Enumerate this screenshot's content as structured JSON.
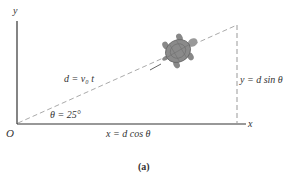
{
  "figure": {
    "caption": "(a)",
    "axes": {
      "y_label": "y",
      "x_label": "x",
      "origin_label": "O"
    },
    "labels": {
      "hypotenuse": "d = v₀ t",
      "angle": "θ = 25°",
      "horizontal_component": "x = d cos θ",
      "vertical_component": "y = d sin θ"
    },
    "angle_deg": 25,
    "object": "turtle-illustration",
    "colors": {
      "axis": "#333333",
      "dashed": "#aaaaaa",
      "turtle": "#8a8a8a"
    }
  }
}
